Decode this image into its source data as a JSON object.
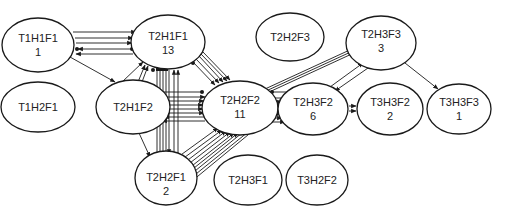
{
  "diagram": {
    "type": "directed-graph",
    "nodes": [
      {
        "id": "T1H1F1",
        "label": "T1H1F1",
        "count": "1",
        "cx": 38,
        "cy": 45
      },
      {
        "id": "T2H1F1",
        "label": "T2H1F1",
        "count": "13",
        "cx": 168,
        "cy": 42
      },
      {
        "id": "T2H2F3",
        "label": "T2H2F3",
        "count": "",
        "cx": 290,
        "cy": 37
      },
      {
        "id": "T2H3F3",
        "label": "T2H3F3",
        "count": "3",
        "cx": 381,
        "cy": 43
      },
      {
        "id": "T1H2F1",
        "label": "T1H2F1",
        "count": "",
        "cx": 38,
        "cy": 107
      },
      {
        "id": "T2H1F2",
        "label": "T2H1F2",
        "count": "",
        "cx": 133,
        "cy": 107
      },
      {
        "id": "T2H2F2",
        "label": "T2H2F2",
        "count": "11",
        "cx": 240,
        "cy": 108
      },
      {
        "id": "T2H3F2",
        "label": "T2H3F2",
        "count": "6",
        "cx": 313,
        "cy": 109
      },
      {
        "id": "T3H3F2",
        "label": "T3H3F2",
        "count": "2",
        "cx": 390,
        "cy": 109
      },
      {
        "id": "T3H3F3",
        "label": "T3H3F3",
        "count": "1",
        "cx": 459,
        "cy": 109
      },
      {
        "id": "T2H2F1",
        "label": "T2H2F1",
        "count": "2",
        "cx": 166,
        "cy": 178
      },
      {
        "id": "T2H3F1",
        "label": "T2H3F1",
        "count": "",
        "cx": 248,
        "cy": 178
      },
      {
        "id": "T3H2F2",
        "label": "T3H2F2",
        "count": "",
        "cx": 323,
        "cy": 178
      }
    ],
    "edges": [
      {
        "from": "T1H1F1",
        "to": "T2H1F1",
        "multiplicity": 3
      },
      {
        "from": "T2H1F1",
        "to": "T1H1F1",
        "multiplicity": 2
      },
      {
        "from": "T1H1F1",
        "to": "T2H1F2",
        "multiplicity": 1
      },
      {
        "from": "T2H1F2",
        "to": "T2H1F1",
        "multiplicity": 3
      },
      {
        "from": "T2H1F1",
        "to": "T2H2F2",
        "multiplicity": 5
      },
      {
        "from": "T2H1F1",
        "to": "T2H2F1",
        "multiplicity": 7
      },
      {
        "from": "T2H1F2",
        "to": "T2H2F2",
        "multiplicity": 8
      },
      {
        "from": "T2H1F2",
        "to": "T2H2F1",
        "multiplicity": 1
      },
      {
        "from": "T2H2F2",
        "to": "T2H2F1",
        "multiplicity": 9
      },
      {
        "from": "T2H2F2",
        "to": "T2H3F3",
        "multiplicity": 3
      },
      {
        "from": "T2H2F2",
        "to": "T2H3F2",
        "multiplicity": 6
      },
      {
        "from": "T2H3F2",
        "to": "T2H3F3",
        "multiplicity": 1
      },
      {
        "from": "T2H3F3",
        "to": "T2H3F2",
        "multiplicity": 1
      },
      {
        "from": "T2H3F2",
        "to": "T3H3F2",
        "multiplicity": 2
      },
      {
        "from": "T2H3F3",
        "to": "T3H3F3",
        "multiplicity": 1
      }
    ]
  }
}
